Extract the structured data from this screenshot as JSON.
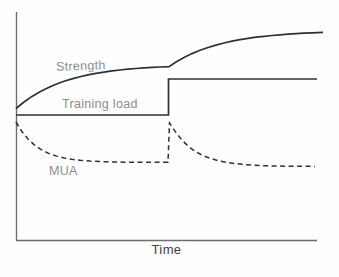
{
  "figure": {
    "background": "#fefefe"
  },
  "labels": {
    "strength": "Strength",
    "training_load": "Training load",
    "mua": "MUA",
    "time": "Time"
  },
  "chart_data": {
    "type": "line",
    "title": "",
    "xlabel": "Time",
    "ylabel": "",
    "grid": false,
    "legend": "inline-labels",
    "axis_color": "#6e6e6e",
    "axis_width": 1.4,
    "x_axis": {
      "label": "Time",
      "ticks": [],
      "y_px": 240.5,
      "from_px": 16,
      "to_px": 317
    },
    "y_axis": {
      "label": "",
      "ticks": [],
      "x_px": 16.5,
      "from_px": 12,
      "to_px": 240.5
    },
    "series": [
      {
        "name": "Strength",
        "slug": "strength",
        "line_style": "solid",
        "color": "#303030",
        "width": 1.7,
        "shape": "asymptotic rise, plateau, second asymptotic rise after training-load step",
        "points_px": [
          [
            16,
            108.5
          ],
          [
            24,
            102
          ],
          [
            32,
            96.4
          ],
          [
            40,
            91.7
          ],
          [
            48,
            87.7
          ],
          [
            56,
            84.3
          ],
          [
            64,
            81.3
          ],
          [
            72,
            78.9
          ],
          [
            80,
            76.7
          ],
          [
            88,
            74.9
          ],
          [
            96,
            73.4
          ],
          [
            104,
            72.1
          ],
          [
            112,
            70.9
          ],
          [
            120,
            70
          ],
          [
            128,
            69.2
          ],
          [
            136,
            68.5
          ],
          [
            144,
            67.9
          ],
          [
            152,
            67.4
          ],
          [
            160,
            67
          ],
          [
            169,
            66.6
          ],
          [
            176,
            62
          ],
          [
            184,
            57.5
          ],
          [
            192,
            53.6
          ],
          [
            200,
            50.3
          ],
          [
            208,
            47.5
          ],
          [
            216,
            45.1
          ],
          [
            224,
            43
          ],
          [
            232,
            41.2
          ],
          [
            240,
            39.7
          ],
          [
            248,
            38.4
          ],
          [
            256,
            37.2
          ],
          [
            264,
            36.3
          ],
          [
            272,
            35.5
          ],
          [
            280,
            34.8
          ],
          [
            288,
            34.1
          ],
          [
            296,
            33.6
          ],
          [
            304,
            33.2
          ],
          [
            312,
            32.8
          ],
          [
            323,
            32.4
          ]
        ]
      },
      {
        "name": "Training load",
        "slug": "training-load",
        "line_style": "solid",
        "color": "#303030",
        "width": 1.7,
        "shape": "constant level then upward step to higher constant level",
        "points_px": [
          [
            16,
            115
          ],
          [
            168.5,
            115
          ],
          [
            168.5,
            79
          ],
          [
            317,
            79
          ]
        ]
      },
      {
        "name": "MUA",
        "slug": "mua",
        "line_style": "dashed",
        "dash": "5 3.5",
        "color": "#303030",
        "width": 1.5,
        "shape": "exponential decay to plateau, vertical spike at step, second exponential decay",
        "points_px": [
          [
            16,
            122
          ],
          [
            22,
            131.7
          ],
          [
            28,
            139
          ],
          [
            34,
            144.6
          ],
          [
            40,
            148.9
          ],
          [
            48,
            153.1
          ],
          [
            56,
            155.9
          ],
          [
            64,
            157.9
          ],
          [
            72,
            159.3
          ],
          [
            80,
            160.3
          ],
          [
            90,
            161.1
          ],
          [
            100,
            161.6
          ],
          [
            115,
            162
          ],
          [
            130,
            162.2
          ],
          [
            145,
            162.3
          ],
          [
            168,
            162.3
          ],
          [
            169.5,
            123
          ],
          [
            176,
            132.6
          ],
          [
            182,
            140.1
          ],
          [
            188,
            146
          ],
          [
            194,
            150.5
          ],
          [
            200,
            154
          ],
          [
            206,
            156.8
          ],
          [
            212,
            158.9
          ],
          [
            220,
            161.1
          ],
          [
            228,
            162.6
          ],
          [
            236,
            163.7
          ],
          [
            244,
            164.5
          ],
          [
            252,
            165
          ],
          [
            262,
            165.6
          ],
          [
            272,
            165.9
          ],
          [
            285,
            166.2
          ],
          [
            300,
            166.3
          ],
          [
            315,
            166.4
          ]
        ]
      }
    ]
  }
}
